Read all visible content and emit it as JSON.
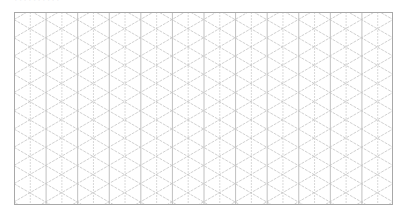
{
  "caption": "··········",
  "grid": {
    "type": "isometric-triangle-grid",
    "left": 14,
    "top": 12,
    "width": 379,
    "height": 193,
    "columns": 24,
    "major_every": 2,
    "angle_deg": 30,
    "colors": {
      "frame": "#a8a8a8",
      "major": "#b0b0b0",
      "minor": "#cfcfcf",
      "diagonal": "#c4c4c4",
      "background": "#ffffff"
    }
  }
}
